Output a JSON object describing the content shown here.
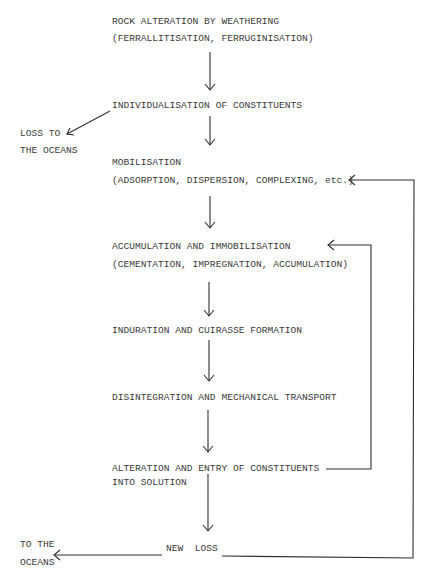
{
  "diagram": {
    "type": "flowchart",
    "nodes": {
      "rock_alteration": {
        "line1": "ROCK ALTERATION BY WEATHERING",
        "line2": "(FERRALLITISATION, FERRUGINISATION)"
      },
      "individualisation": {
        "line1": "INDIVIDUALISATION OF CONSTITUENTS"
      },
      "loss_to_oceans": {
        "line1": "LOSS TO",
        "line2": "THE OCEANS"
      },
      "mobilisation": {
        "line1": "MOBILISATION",
        "line2": "(ADSORPTION, DISPERSION, COMPLEXING, etc.)"
      },
      "accumulation": {
        "line1": "ACCUMULATION AND IMMOBILISATION",
        "line2": "(CEMENTATION, IMPREGNATION, ACCUMULATION)"
      },
      "induration": {
        "line1": "INDURATION AND CUIRASSE FORMATION"
      },
      "disintegration": {
        "line1": "DISINTEGRATION AND MECHANICAL TRANSPORT"
      },
      "alteration_entry": {
        "line1": "ALTERATION AND ENTRY OF CONSTITUENTS",
        "line2": "INTO SOLUTION"
      },
      "new_loss": {
        "line1": "NEW  LOSS"
      },
      "to_the_oceans": {
        "line1": "TO THE",
        "line2": "OCEANS"
      }
    },
    "edges": [
      {
        "from": "rock_alteration",
        "to": "individualisation"
      },
      {
        "from": "individualisation",
        "to": "loss_to_oceans"
      },
      {
        "from": "individualisation",
        "to": "mobilisation"
      },
      {
        "from": "mobilisation",
        "to": "accumulation"
      },
      {
        "from": "accumulation",
        "to": "induration"
      },
      {
        "from": "induration",
        "to": "disintegration"
      },
      {
        "from": "disintegration",
        "to": "alteration_entry"
      },
      {
        "from": "alteration_entry",
        "to": "new_loss"
      },
      {
        "from": "alteration_entry",
        "to": "accumulation",
        "kind": "feedback"
      },
      {
        "from": "new_loss",
        "to": "mobilisation",
        "kind": "feedback"
      },
      {
        "from": "new_loss",
        "to": "to_the_oceans"
      }
    ],
    "colors": {
      "text": "#3a3a3a",
      "lines": "#2e2e2e",
      "background": "#ffffff"
    }
  }
}
